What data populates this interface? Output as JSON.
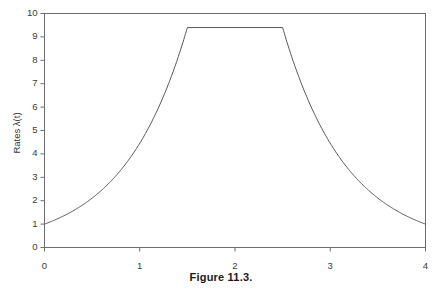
{
  "figure": {
    "caption": "Figure 11.3."
  },
  "chart_data": {
    "type": "line",
    "title": "",
    "xlabel": "",
    "ylabel": "Rates λ(t)",
    "xlim": [
      0,
      4
    ],
    "ylim": [
      0,
      10
    ],
    "grid": false,
    "legend": null,
    "frame": "box",
    "xticks": [
      "0",
      "1",
      "2",
      "3",
      "4"
    ],
    "xtick_values": [
      0,
      1,
      2,
      3,
      4
    ],
    "yticks": [
      "0",
      "1",
      "2",
      "3",
      "4",
      "5",
      "6",
      "7",
      "8",
      "9",
      "10"
    ],
    "ytick_values": [
      0,
      1,
      2,
      3,
      4,
      5,
      6,
      7,
      8,
      9,
      10
    ],
    "line_color": "#555555",
    "plateau_value": 9.4,
    "baseline_value": 1.0,
    "plateau_start": 1.5,
    "plateau_end": 2.5,
    "series": [
      {
        "name": "lambda(t)",
        "x": [
          0.0,
          0.1,
          0.2,
          0.3,
          0.4,
          0.5,
          0.6,
          0.7,
          0.8,
          0.9,
          1.0,
          1.1,
          1.2,
          1.3,
          1.4,
          1.5,
          1.6,
          1.7,
          1.8,
          1.9,
          2.0,
          2.1,
          2.2,
          2.3,
          2.4,
          2.5,
          2.6,
          2.7,
          2.8,
          2.9,
          3.0,
          3.1,
          3.2,
          3.3,
          3.4,
          3.5,
          3.6,
          3.7,
          3.8,
          3.9,
          4.0
        ],
        "y": [
          1.0,
          1.11,
          1.23,
          1.36,
          1.51,
          1.67,
          1.85,
          2.05,
          2.27,
          2.51,
          2.78,
          3.08,
          3.41,
          3.78,
          4.19,
          9.4,
          9.4,
          9.4,
          9.4,
          9.4,
          9.4,
          9.4,
          9.4,
          9.4,
          9.4,
          9.4,
          7.35,
          5.75,
          4.49,
          3.51,
          2.75,
          2.15,
          1.68,
          1.31,
          1.03,
          1.0,
          1.0,
          1.0,
          1.0,
          1.0,
          1.0
        ]
      }
    ]
  }
}
